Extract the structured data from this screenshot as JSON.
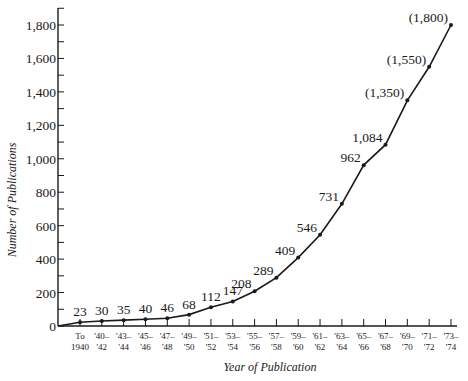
{
  "chart_data": {
    "type": "line",
    "title": "",
    "xlabel": "Year of Publication",
    "ylabel": "Number of Publications",
    "ylim": [
      0,
      1900
    ],
    "yticks": [
      0,
      200,
      400,
      600,
      800,
      1000,
      1200,
      1400,
      1600,
      1800
    ],
    "ytick_labels": [
      "0",
      "200",
      "400",
      "600",
      "800",
      "1,000",
      "1,200",
      "1,400",
      "1,600",
      "1,800"
    ],
    "categories": [
      [
        "To",
        "1940"
      ],
      [
        "'40–",
        "'42"
      ],
      [
        "'43–",
        "'44"
      ],
      [
        "'45–",
        "'46"
      ],
      [
        "'47–",
        "'48"
      ],
      [
        "'49–",
        "'50"
      ],
      [
        "'51–",
        "'52"
      ],
      [
        "'53–",
        "'54"
      ],
      [
        "'55–",
        "'56"
      ],
      [
        "'57–",
        "'58"
      ],
      [
        "'59–",
        "'60"
      ],
      [
        "'61–",
        "'62"
      ],
      [
        "'63–",
        "'64"
      ],
      [
        "'65–",
        "'66"
      ],
      [
        "'67–",
        "'68"
      ],
      [
        "'69–",
        "'70"
      ],
      [
        "'71–",
        "'72"
      ],
      [
        "'73–",
        "'74"
      ]
    ],
    "values": [
      23,
      30,
      35,
      40,
      46,
      68,
      112,
      147,
      208,
      289,
      409,
      546,
      731,
      962,
      1084,
      1350,
      1550,
      1800
    ],
    "value_labels": [
      "23",
      "30",
      "35",
      "40",
      "46",
      "68",
      "112",
      "147",
      "208",
      "289",
      "409",
      "546",
      "731",
      "962",
      "1,084",
      "(1,350)",
      "(1,550)",
      "(1,800)"
    ],
    "estimated_note_parenthesized": true,
    "grid": false,
    "legend": null
  }
}
